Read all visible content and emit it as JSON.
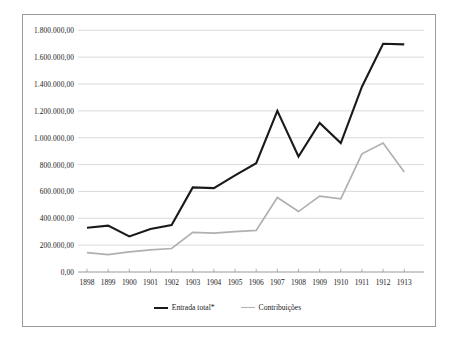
{
  "chart_data": {
    "type": "line",
    "title": "",
    "xlabel": "",
    "ylabel": "",
    "categories": [
      "1898",
      "1899",
      "1900",
      "1901",
      "1902",
      "1903",
      "1904",
      "1905",
      "1906",
      "1907",
      "1908",
      "1909",
      "1910",
      "1911",
      "1912",
      "1913"
    ],
    "series": [
      {
        "name": "Entrada total*",
        "color": "#1a1a1a",
        "values": [
          330000,
          345000,
          265000,
          320000,
          350000,
          630000,
          625000,
          720000,
          810000,
          1200000,
          860000,
          1110000,
          960000,
          1380000,
          1700000,
          1695000
        ]
      },
      {
        "name": "Contribuições",
        "color": "#b0b0b0",
        "values": [
          145000,
          130000,
          150000,
          165000,
          175000,
          295000,
          290000,
          300000,
          310000,
          555000,
          450000,
          565000,
          545000,
          880000,
          960000,
          745000
        ]
      }
    ],
    "ylim": [
      0,
      1800000
    ],
    "ytick_values": [
      0,
      200000,
      400000,
      600000,
      800000,
      1000000,
      1200000,
      1400000,
      1600000,
      1800000
    ],
    "ytick_labels": [
      "0,00",
      "200.000,00",
      "400.000,00",
      "600.000,00",
      "800.000,00",
      "1.000.000,00",
      "1.200.000,00",
      "1.400.000,00",
      "1.600.000,00",
      "1.800.000,00"
    ],
    "grid": true,
    "grid_color": "#c8c8c8",
    "legend_position": "bottom",
    "frame_color": "#9a9a9a",
    "background": "#ffffff"
  }
}
